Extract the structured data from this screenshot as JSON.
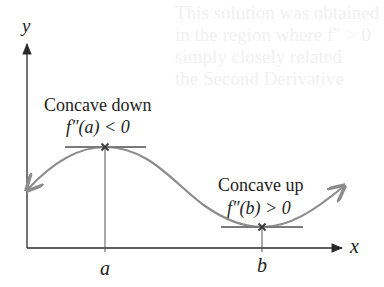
{
  "figure": {
    "axes": {
      "x_label": "x",
      "y_label": "y"
    },
    "ticks": {
      "a": "a",
      "b": "b"
    },
    "annotations": {
      "max": {
        "title": "Concave down",
        "condition": "f″(a) < 0",
        "point": "local maximum at x = a (horizontal tangent)"
      },
      "min": {
        "title": "Concave up",
        "condition": "f″(b) > 0",
        "point": "local minimum at x = b (horizontal tangent)"
      }
    },
    "colors": {
      "axes": "#2a2a2a",
      "curve": "#8c8c8c",
      "tangent": "#7a7a7a",
      "marker": "#3a3a3a",
      "text": "#222222"
    }
  },
  "background_showthrough": {
    "line1": "This solution was obtained",
    "line2": "in the region where f″ > 0",
    "line3": "simply closely related",
    "line4": "the Second Derivative"
  }
}
